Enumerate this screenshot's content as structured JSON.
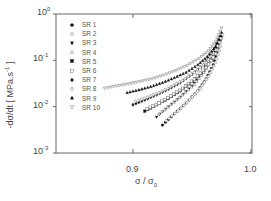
{
  "chart_data": {
    "type": "scatter",
    "title": "",
    "xlabel": "σ / σ0",
    "ylabel": "-dσ/dt [ MPa.s-1 ]",
    "xlim": [
      0.84,
      1.0
    ],
    "ylim": [
      0.001,
      1
    ],
    "yscale": "log",
    "x_ticks": [
      0.9,
      1.0
    ],
    "x_tick_labels": [
      "0.9",
      "1.0"
    ],
    "y_ticks": [
      1,
      0.1,
      0.01,
      0.001
    ],
    "y_tick_labels": [
      "10^0",
      "10^-1",
      "10^-2",
      "10^-3"
    ],
    "grid": false,
    "legend_position": "upper left",
    "series": [
      {
        "name": "SR 1",
        "marker": "filled-circle",
        "x": [
          0.925,
          0.935,
          0.945,
          0.955,
          0.962,
          0.968,
          0.972
        ],
        "y": [
          0.004,
          0.007,
          0.012,
          0.022,
          0.04,
          0.08,
          0.18
        ]
      },
      {
        "name": "SR 2",
        "marker": "open-circle",
        "x": [
          0.928,
          0.938,
          0.948,
          0.957,
          0.964,
          0.97,
          0.974
        ],
        "y": [
          0.005,
          0.008,
          0.014,
          0.025,
          0.045,
          0.09,
          0.2
        ]
      },
      {
        "name": "SR 3",
        "marker": "filled-triangle-down",
        "x": [
          0.92,
          0.93,
          0.94,
          0.95,
          0.958,
          0.965,
          0.971
        ],
        "y": [
          0.006,
          0.01,
          0.016,
          0.028,
          0.05,
          0.1,
          0.22
        ]
      },
      {
        "name": "SR 4",
        "marker": "open-triangle-up",
        "x": [
          0.922,
          0.932,
          0.942,
          0.952,
          0.96,
          0.967,
          0.972
        ],
        "y": [
          0.007,
          0.011,
          0.018,
          0.03,
          0.055,
          0.11,
          0.24
        ]
      },
      {
        "name": "SR 5",
        "marker": "filled-square",
        "x": [
          0.91,
          0.92,
          0.93,
          0.94,
          0.95,
          0.96,
          0.968,
          0.974
        ],
        "y": [
          0.008,
          0.011,
          0.015,
          0.022,
          0.035,
          0.06,
          0.12,
          0.28
        ]
      },
      {
        "name": "SR 6",
        "marker": "open-square",
        "x": [
          0.912,
          0.922,
          0.932,
          0.942,
          0.952,
          0.962,
          0.97,
          0.975
        ],
        "y": [
          0.009,
          0.012,
          0.017,
          0.025,
          0.04,
          0.07,
          0.14,
          0.3
        ]
      },
      {
        "name": "SR 7",
        "marker": "filled-diamond",
        "x": [
          0.9,
          0.91,
          0.92,
          0.93,
          0.94,
          0.95,
          0.96,
          0.968,
          0.975
        ],
        "y": [
          0.011,
          0.014,
          0.018,
          0.024,
          0.033,
          0.05,
          0.08,
          0.15,
          0.33
        ]
      },
      {
        "name": "SR 8",
        "marker": "open-diamond",
        "x": [
          0.902,
          0.912,
          0.922,
          0.932,
          0.942,
          0.952,
          0.962,
          0.97,
          0.976
        ],
        "y": [
          0.013,
          0.016,
          0.02,
          0.027,
          0.037,
          0.055,
          0.09,
          0.17,
          0.36
        ]
      },
      {
        "name": "SR 9",
        "marker": "filled-triangle-up",
        "x": [
          0.895,
          0.905,
          0.915,
          0.925,
          0.935,
          0.945,
          0.955,
          0.963,
          0.97,
          0.975
        ],
        "y": [
          0.02,
          0.023,
          0.027,
          0.033,
          0.042,
          0.055,
          0.08,
          0.12,
          0.2,
          0.4
        ]
      },
      {
        "name": "SR 10",
        "marker": "open-triangle-down",
        "x": [
          0.876,
          0.886,
          0.896,
          0.906,
          0.916,
          0.926,
          0.936,
          0.946,
          0.956,
          0.964,
          0.97,
          0.975
        ],
        "y": [
          0.025,
          0.028,
          0.031,
          0.035,
          0.04,
          0.048,
          0.06,
          0.078,
          0.11,
          0.16,
          0.26,
          0.5
        ]
      }
    ]
  }
}
